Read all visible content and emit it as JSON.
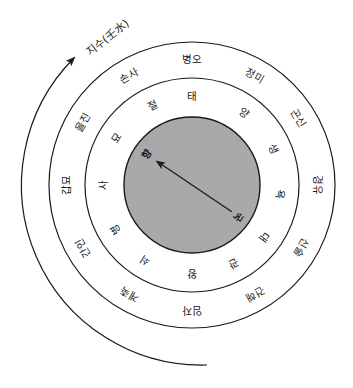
{
  "diagram": {
    "center": [
      192,
      185
    ],
    "colors": {
      "line": "#1a1a1a",
      "inner_disk": "#a9a9a9",
      "background": "#ffffff"
    },
    "flow_arrow": {
      "label": "지수(壬水)",
      "direction": "clockwise"
    },
    "outer_ring": {
      "radius": 143,
      "labels": [
        {
          "text": "병오",
          "angle": 0
        },
        {
          "text": "정미",
          "angle": 30
        },
        {
          "text": "곤신",
          "angle": 58
        },
        {
          "text": "경유",
          "angle": 90
        },
        {
          "text": "신술",
          "angle": 120
        },
        {
          "text": "건해",
          "angle": 150
        },
        {
          "text": "임자",
          "angle": 180
        },
        {
          "text": "계축",
          "angle": 210
        },
        {
          "text": "간인",
          "angle": 240
        },
        {
          "text": "갑묘",
          "angle": 270
        },
        {
          "text": "을진",
          "angle": 300
        },
        {
          "text": "손사",
          "angle": 330
        }
      ]
    },
    "middle_ring": {
      "radius": 107,
      "labels": [
        {
          "text": "태",
          "angle": 0
        },
        {
          "text": "양",
          "angle": 36
        },
        {
          "text": "생",
          "angle": 66
        },
        {
          "text": "욕",
          "angle": 96
        },
        {
          "text": "대",
          "angle": 126
        },
        {
          "text": "관",
          "angle": 152
        },
        {
          "text": "왕",
          "angle": 180
        },
        {
          "text": "쇠",
          "angle": 212
        },
        {
          "text": "병",
          "angle": 240
        },
        {
          "text": "사",
          "angle": 270
        },
        {
          "text": "묘",
          "angle": 302
        },
        {
          "text": "절",
          "angle": 334
        }
      ]
    },
    "inner_disk": {
      "radius": 68,
      "pointer": {
        "from_label": "국",
        "to_label": "향",
        "from_angle": 124,
        "to_angle": 304
      }
    }
  }
}
